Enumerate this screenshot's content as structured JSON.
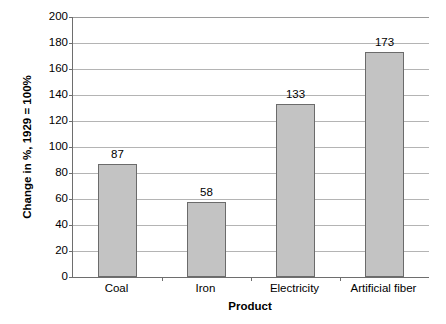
{
  "chart_data": {
    "type": "bar",
    "title": "",
    "subtitle": "",
    "xlabel": "Product",
    "ylabel": "Change in %, 1929 = 100%",
    "categories": [
      "Coal",
      "Iron",
      "Electricity",
      "Artificial fiber"
    ],
    "values": [
      87,
      58,
      133,
      173
    ],
    "data_labels": [
      "87",
      "58",
      "133",
      "173"
    ],
    "ylim": [
      0,
      200
    ],
    "ytick_step": 20,
    "yticks": [
      0,
      20,
      40,
      60,
      80,
      100,
      120,
      140,
      160,
      180,
      200
    ],
    "ytick_labels": [
      "0",
      "20",
      "40",
      "60",
      "80",
      "100",
      "120",
      "140",
      "160",
      "180",
      "200"
    ],
    "grid": "horizontal",
    "legend": "none",
    "series": [
      {
        "name": "Change in %",
        "values": [
          87,
          58,
          133,
          173
        ]
      }
    ],
    "colors": {
      "bar_fill": "#c3c3c3",
      "bar_border": "#6b6b6b",
      "gridline": "#b4b4b4",
      "axis": "#6e6e6e",
      "text": "#000000",
      "background": "#ffffff"
    }
  },
  "axes": {
    "y_title": "Change in %, 1929 = 100%",
    "x_title": "Product"
  }
}
